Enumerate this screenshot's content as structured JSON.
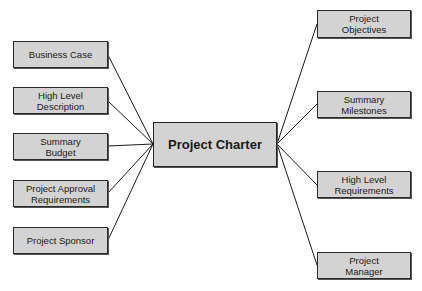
{
  "diagram": {
    "type": "mind-map",
    "center": {
      "label": "Project Charter"
    },
    "left_nodes": [
      {
        "label": "Business Case"
      },
      {
        "label": "High Level\nDescription"
      },
      {
        "label": "Summary\nBudget"
      },
      {
        "label": "Project Approval\nRequirements"
      },
      {
        "label": "Project Sponsor"
      }
    ],
    "right_nodes": [
      {
        "label": "Project\nObjectives"
      },
      {
        "label": "Summary\nMilestones"
      },
      {
        "label": "High Level\nRequirements"
      },
      {
        "label": "Project\nManager"
      }
    ],
    "colors": {
      "box_fill": "#d3d3d3",
      "border": "#2a2a2a",
      "line": "#1a1a1a"
    }
  }
}
